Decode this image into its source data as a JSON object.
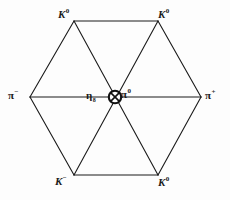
{
  "figure": {
    "type": "particle-multiplet-hexagon",
    "background_color": "#fdfdfd",
    "line_color": "#1a1a1a",
    "line_width": 1
  },
  "geometry": {
    "vertices": [
      {
        "id": "top-left",
        "x": 74,
        "y": 21
      },
      {
        "id": "top-right",
        "x": 158,
        "y": 21
      },
      {
        "id": "right",
        "x": 201,
        "y": 97
      },
      {
        "id": "bottom-right",
        "x": 158,
        "y": 175
      },
      {
        "id": "bottom-left",
        "x": 74,
        "y": 175
      },
      {
        "id": "left",
        "x": 30,
        "y": 97
      }
    ],
    "center": {
      "x": 115,
      "y": 97
    },
    "edges": [
      [
        "top-left",
        "top-right"
      ],
      [
        "top-right",
        "right"
      ],
      [
        "right",
        "bottom-right"
      ],
      [
        "bottom-right",
        "bottom-left"
      ],
      [
        "bottom-left",
        "left"
      ],
      [
        "left",
        "top-left"
      ]
    ],
    "diagonals": [
      [
        "left",
        "right"
      ],
      [
        "top-left",
        "bottom-right"
      ],
      [
        "top-right",
        "bottom-left"
      ]
    ]
  },
  "labels": {
    "k0_top_left": {
      "symbol": "K",
      "charge": "0"
    },
    "k0_top_right": {
      "symbol": "K",
      "charge": "0"
    },
    "pi_minus": {
      "symbol": "π",
      "charge": "−"
    },
    "pi_plus": {
      "symbol": "π",
      "charge": "+"
    },
    "k_minus": {
      "symbol": "K",
      "charge": "−"
    },
    "k0_bottom_right": {
      "symbol": "K",
      "charge": "0"
    },
    "eta": {
      "symbol": "η",
      "subscript": "8"
    },
    "pi_zero": {
      "symbol": "π",
      "charge": "0"
    }
  },
  "center_marker": {
    "glyph": "circled-x",
    "radius": 6,
    "stroke_width": 2
  }
}
